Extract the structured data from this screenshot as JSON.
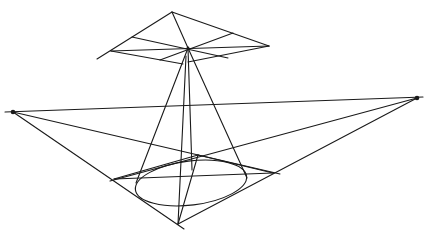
{
  "diagram": {
    "title": "",
    "stroke_color": "#1a1a1a",
    "background": "#ffffff",
    "vanishing_points": {
      "left": {
        "x": 13,
        "y": 112
      },
      "right": {
        "x": 417,
        "y": 98
      }
    },
    "horizon_line": {
      "x1": 5,
      "y1": 112,
      "x2": 423,
      "y2": 97
    },
    "top_diamond": {
      "top": {
        "x": 172,
        "y": 12
      },
      "right": {
        "x": 269,
        "y": 46
      },
      "bottom": {
        "x": 183,
        "y": 64
      },
      "left": {
        "x": 111,
        "y": 51
      },
      "center": {
        "x": 188,
        "y": 48
      }
    },
    "base_square": {
      "top": {
        "x": 198,
        "y": 155
      },
      "right": {
        "x": 273,
        "y": 173
      },
      "bottom": {
        "x": 178,
        "y": 224
      },
      "left": {
        "x": 114,
        "y": 179
      }
    },
    "ellipse": {
      "cx": 191,
      "cy": 183,
      "rx": 56,
      "ry": 22,
      "rotate": -7
    },
    "labels": []
  }
}
